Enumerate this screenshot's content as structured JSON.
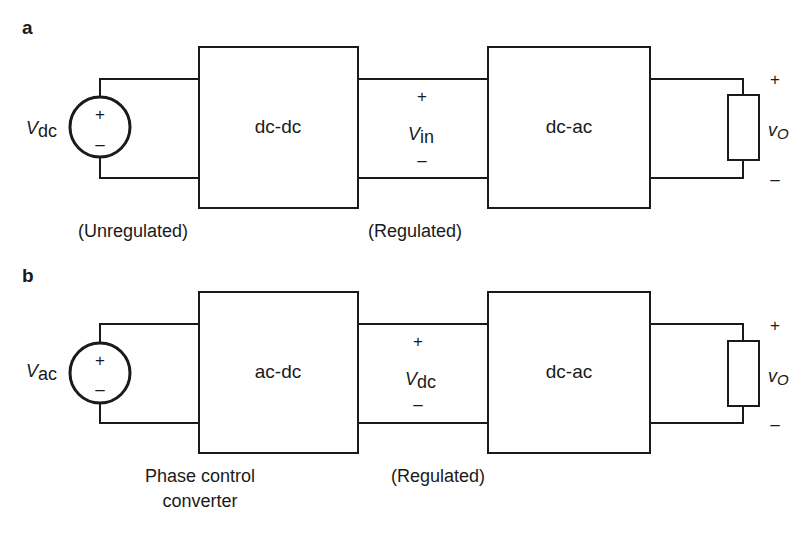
{
  "panels": [
    {
      "id": "a",
      "label": "a",
      "source": {
        "type": "dc-source",
        "symbol": "V",
        "subscript": "dc",
        "plus": "+",
        "minus": "–"
      },
      "block1": {
        "label": "dc-dc"
      },
      "mid_voltage": {
        "symbol": "V",
        "subscript": "in",
        "plus": "+",
        "minus": "–"
      },
      "block2": {
        "label": "dc-ac"
      },
      "load": {
        "symbol": "v",
        "subscript": "O",
        "plus": "+",
        "minus": "–"
      },
      "caption_left": "(Unregulated)",
      "caption_mid": "(Regulated)"
    },
    {
      "id": "b",
      "label": "b",
      "source": {
        "type": "ac-source",
        "symbol": "V",
        "subscript": "ac",
        "plus": "+",
        "minus": "–"
      },
      "block1": {
        "label": "ac-dc"
      },
      "mid_voltage": {
        "symbol": "V",
        "subscript": "dc",
        "plus": "+",
        "minus": "–"
      },
      "block2": {
        "label": "dc-ac"
      },
      "load": {
        "symbol": "v",
        "subscript": "O",
        "plus": "+",
        "minus": "–"
      },
      "caption_left_line1": "Phase control",
      "caption_left_line2": "converter",
      "caption_mid": "(Regulated)"
    }
  ],
  "colors": {
    "line": "#1a1a1a",
    "background": "#ffffff"
  }
}
